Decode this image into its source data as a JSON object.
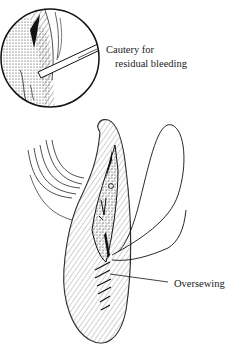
{
  "figure": {
    "labels": {
      "cautery_line1": "Cautery for",
      "cautery_line2": "residual bleeding",
      "oversewing": "Oversewing"
    },
    "colors": {
      "ink": "#1a1a1a",
      "paper": "#ffffff"
    }
  }
}
